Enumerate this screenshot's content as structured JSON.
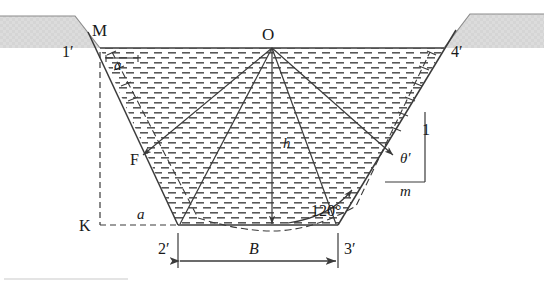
{
  "figure": {
    "labels": {
      "point_M": "M",
      "point_O": "O",
      "point_F": "F",
      "point_K": "K",
      "corner_1p": "1′",
      "corner_4p": "4′",
      "corner_2p": "2′",
      "corner_3p": "3′",
      "freeboard_top": "a",
      "freeboard_bottom": "a",
      "depth": "h",
      "bottom_width": "B",
      "angle_theta": "θ′",
      "slope_rise": "1",
      "slope_run": "m",
      "arc_angle": "120°"
    }
  },
  "colors": {
    "ground_fill": "#d9d9d9",
    "ground_stroke": "#8c8c8c",
    "line": "#3a3a3a",
    "water_hatch": "#555555",
    "text": "#1a1a1a",
    "background": "#ffffff"
  },
  "geometry": {
    "water_surface_y": 48,
    "bottom_y": 225,
    "left_top_x": 100,
    "right_top_x": 444,
    "left_bottom_x": 178,
    "right_bottom_x": 338,
    "apex_O_x": 272,
    "apex_O_y": 48
  },
  "caption_rule": ""
}
